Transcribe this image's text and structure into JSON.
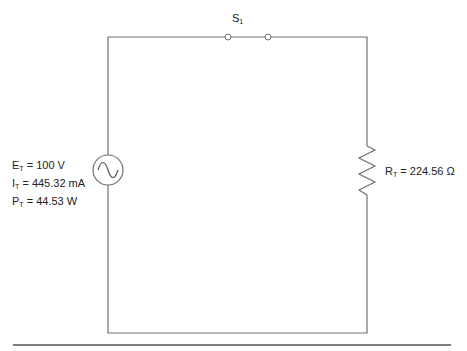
{
  "diagram": {
    "type": "series circuit",
    "switch": {
      "name": "S",
      "subscript": "1",
      "state": "open"
    },
    "source": {
      "symbol": "ac-voltage-source",
      "labels": [
        {
          "name": "E",
          "subscript": "T",
          "value": " = 100 V"
        },
        {
          "name": "I",
          "subscript": "T",
          "value": " = 445.32 mA"
        },
        {
          "name": "P",
          "subscript": "T",
          "value": " = 44.53 W"
        }
      ]
    },
    "resistor": {
      "name": "R",
      "subscript": "T",
      "value": " = 224.56 Ω"
    },
    "colors": {
      "wire": "#707070",
      "text": "#222222",
      "rule": "#555555"
    }
  }
}
